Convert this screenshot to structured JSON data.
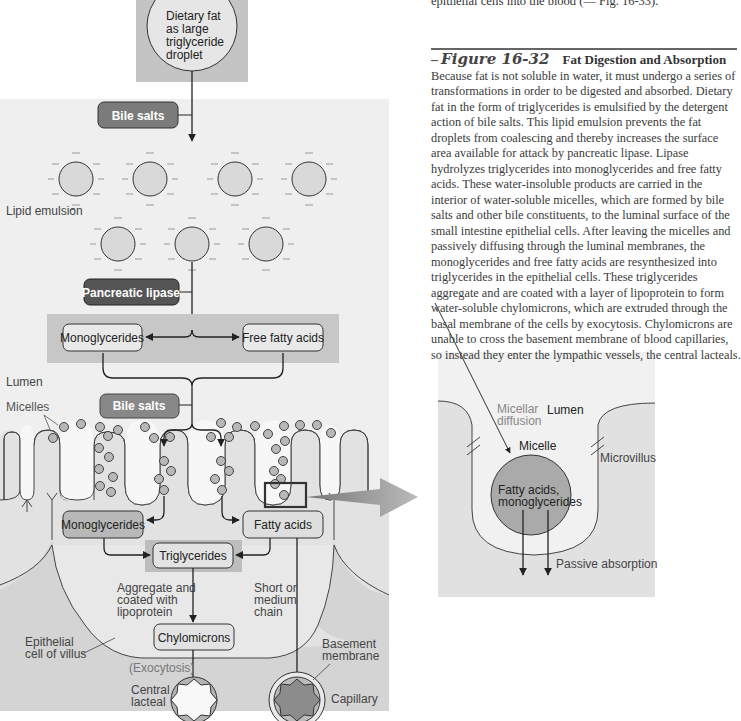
{
  "page": {
    "top_snippet": "epithelial cells into the blood (— Fig. 16-33)."
  },
  "caption": {
    "dash": "–",
    "figure_number": "Figure 16-32",
    "title": "Fat Digestion and Absorption",
    "body": "Because fat is not soluble in water, it must undergo a series of transformations in order to be digested and absorbed. Dietary fat in the form of triglycerides is emulsified by the detergent action of bile salts. This lipid emulsion prevents the fat droplets from coalescing and thereby increases the surface area available for attack by pancreatic lipase. Lipase hydrolyzes triglycerides into monoglycerides and free fatty acids. These water-insoluble products are carried in the interior of water-soluble micelles, which are formed by bile salts and other bile constituents, to the luminal surface of the small intestine epithelial cells. After leaving the micelles and passively diffusing through the luminal membranes, the monoglycerides and free fatty acids are resynthesized into triglycerides in the epithelial cells. These triglycerides aggregate and are coated with a layer of lipoprotein to form water-soluble chylomicrons, which are extruded through the basal membrane of the cells by exocytosis. Chylomicrons are unable to cross the basement membrane of blood capillaries, so instead they enter the lympathic vessels, the central lacteals."
  },
  "main_diagram": {
    "droplet": {
      "lines": [
        "Dietary fat",
        "as large",
        "triglyceride",
        "droplet"
      ]
    },
    "bile_salts_1": "Bile salts",
    "lipid_emulsion_label": "Lipid emulsion",
    "pancreatic_lipase": "Pancreatic lipase",
    "monoglycerides_top": "Monoglycerides",
    "free_fatty_acids": "Free fatty acids",
    "lumen_label": "Lumen",
    "bile_salts_2": "Bile salts",
    "micelles_label": "Micelles",
    "monoglycerides_cell": "Monoglycerides",
    "fatty_acids_cell": "Fatty acids",
    "triglycerides": "Triglycerides",
    "aggregate_label": [
      "Aggregate and",
      "coated with",
      "lipoprotein"
    ],
    "short_chain_label": [
      "Short or",
      "medium",
      "chain"
    ],
    "chylomicrons": "Chylomicrons",
    "epithelial_label": [
      "Epithelial",
      "cell of villus"
    ],
    "exocytosis_label": "(Exocytosis)",
    "central_lacteal_label": [
      "Central",
      "lacteal"
    ],
    "basement_membrane_label": [
      "Basement",
      "membrane"
    ],
    "capillary_label": "Capillary"
  },
  "inset_diagram": {
    "lumen_label": "Lumen",
    "micellar_diffusion_label": [
      "Micellar",
      "diffusion"
    ],
    "micelle_label": "Micelle",
    "microvillus_label": "Microvillus",
    "contents_label": [
      "Fatty acids,",
      "monoglycerides"
    ],
    "passive_absorption_label": "Passive absorption"
  },
  "colors": {
    "panel_bg": "#eeeeee",
    "panel_dark": "#cfcfcf",
    "droplet_panel": "#bdbdbd",
    "pill_dark": "#555555",
    "pill_medium": "#7d7d7d",
    "micelle_fill": "#b5b5b5",
    "outline": "#333333",
    "arrow_gray": "#a9a9a9",
    "capillary_fill": "#8a8a8a"
  }
}
